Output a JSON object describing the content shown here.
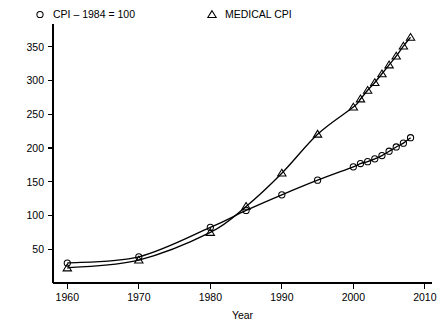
{
  "chart_data": {
    "type": "line",
    "title": "",
    "xlabel": "Year",
    "ylabel": "",
    "xlim": [
      1958,
      2011
    ],
    "ylim": [
      0,
      375
    ],
    "xticks": [
      1960,
      1970,
      1980,
      1990,
      2000,
      2010
    ],
    "yticks": [
      50,
      100,
      150,
      200,
      250,
      300,
      350
    ],
    "grid": false,
    "legend_position": "top",
    "series": [
      {
        "name": "CPI – 1984 = 100",
        "marker": "circle",
        "x": [
          1960,
          1970,
          1980,
          1985,
          1990,
          1995,
          2000,
          2001,
          2002,
          2003,
          2004,
          2005,
          2006,
          2007,
          2008
        ],
        "values": [
          29.6,
          38.8,
          82.4,
          107.6,
          130.7,
          152.4,
          172.2,
          177.1,
          179.9,
          184.0,
          188.9,
          195.3,
          201.6,
          207.3,
          215.3
        ]
      },
      {
        "name": "MEDICAL CPI",
        "marker": "triangle",
        "x": [
          1960,
          1970,
          1980,
          1985,
          1990,
          1995,
          2000,
          2001,
          2002,
          2003,
          2004,
          2005,
          2006,
          2007,
          2008
        ],
        "values": [
          22.3,
          34.0,
          74.9,
          113.5,
          162.8,
          220.5,
          260.8,
          272.8,
          285.6,
          297.1,
          310.1,
          323.2,
          336.2,
          351.1,
          364.1
        ]
      }
    ]
  },
  "legend": {
    "items": [
      {
        "label": "CPI – 1984 = 100",
        "marker": "circle"
      },
      {
        "label": "MEDICAL CPI",
        "marker": "triangle"
      }
    ]
  },
  "axes": {
    "x_title": "Year",
    "x_tick_labels": [
      "1960",
      "1970",
      "1980",
      "1990",
      "2000",
      "2010"
    ],
    "y_tick_labels": [
      "50",
      "100",
      "150",
      "200",
      "250",
      "300",
      "350"
    ]
  },
  "colors": {
    "line": "#000000",
    "axis": "#000000",
    "background": "#ffffff"
  }
}
